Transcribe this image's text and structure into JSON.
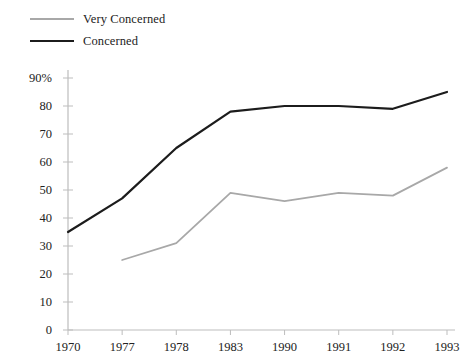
{
  "legend": {
    "position": "top-left",
    "items": [
      {
        "label": "Very Concerned",
        "color": "#a8a8a8",
        "key": "very_concerned"
      },
      {
        "label": "Concerned",
        "color": "#1c1c1c",
        "key": "concerned"
      }
    ]
  },
  "chart_data": {
    "type": "line",
    "title": "",
    "subtitle": "",
    "xlabel": "",
    "ylabel": "",
    "categories": [
      "1970",
      "1977",
      "1978",
      "1983",
      "1990",
      "1991",
      "1992",
      "1993"
    ],
    "series": [
      {
        "name": "Very Concerned",
        "color": "#a8a8a8",
        "values": [
          null,
          25,
          31,
          49,
          46,
          49,
          48,
          58
        ]
      },
      {
        "name": "Concerned",
        "color": "#1c1c1c",
        "values": [
          35,
          47,
          65,
          78,
          80,
          80,
          79,
          85
        ]
      }
    ],
    "ylim": [
      0,
      90
    ],
    "ytick_values": [
      0,
      10,
      20,
      30,
      40,
      50,
      60,
      70,
      80,
      90
    ],
    "ytick_labels": [
      "0",
      "10",
      "20",
      "30",
      "40",
      "50",
      "60",
      "70",
      "80",
      "90%"
    ],
    "grid": false,
    "axis_color": "#bdbdbd",
    "legend_position": "top-left"
  }
}
